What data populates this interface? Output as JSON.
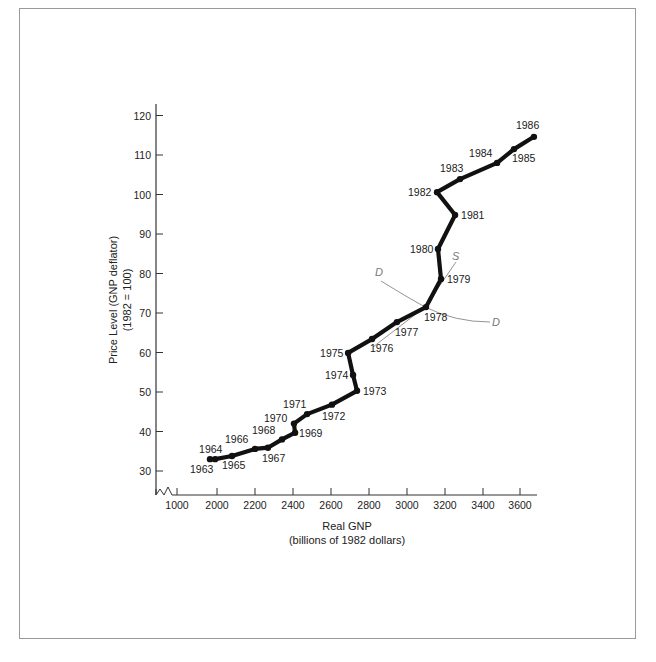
{
  "chart_data": {
    "type": "line",
    "title": "",
    "xlabel": "Real GNP",
    "xlabel_sub": "(billions of 1982 dollars)",
    "ylabel": "Price Level (GNP deflator)",
    "ylabel_sub": "(1982 = 100)",
    "x_ticks": [
      "1000",
      "2000",
      "2200",
      "2400",
      "2600",
      "2800",
      "3000",
      "3200",
      "3400",
      "3600"
    ],
    "y_ticks": [
      "30",
      "40",
      "50",
      "60",
      "70",
      "80",
      "90",
      "100",
      "110",
      "120"
    ],
    "xlim": [
      1900,
      3700
    ],
    "ylim": [
      25,
      122
    ],
    "x_axis_break": true,
    "grid": false,
    "legend": null,
    "series": [
      {
        "name": "Real GNP vs Price Level",
        "points": [
          {
            "year": "1963",
            "x": 1963,
            "y": 33.0
          },
          {
            "year": "1964",
            "x": 1990,
            "y": 33.0
          },
          {
            "year": "1965",
            "x": 2079,
            "y": 33.8
          },
          {
            "year": "1966",
            "x": 2200,
            "y": 35.6
          },
          {
            "year": "1967",
            "x": 2268,
            "y": 35.9
          },
          {
            "year": "1968",
            "x": 2342,
            "y": 38.0
          },
          {
            "year": "1969",
            "x": 2411,
            "y": 39.7
          },
          {
            "year": "1970",
            "x": 2405,
            "y": 42.0
          },
          {
            "year": "1971",
            "x": 2474,
            "y": 44.4
          },
          {
            "year": "1972",
            "x": 2605,
            "y": 46.8
          },
          {
            "year": "1973",
            "x": 2737,
            "y": 50.3
          },
          {
            "year": "1974",
            "x": 2716,
            "y": 54.3
          },
          {
            "year": "1975",
            "x": 2690,
            "y": 59.9
          },
          {
            "year": "1976",
            "x": 2816,
            "y": 63.4
          },
          {
            "year": "1977",
            "x": 2947,
            "y": 67.7
          },
          {
            "year": "1978",
            "x": 3100,
            "y": 71.5
          },
          {
            "year": "1979",
            "x": 3179,
            "y": 78.6
          },
          {
            "year": "1980",
            "x": 3163,
            "y": 86.2
          },
          {
            "year": "1981",
            "x": 3253,
            "y": 94.8
          },
          {
            "year": "1982",
            "x": 3158,
            "y": 100.6
          },
          {
            "year": "1983",
            "x": 3279,
            "y": 103.9
          },
          {
            "year": "1984",
            "x": 3474,
            "y": 108.0
          },
          {
            "year": "1985",
            "x": 3563,
            "y": 111.5
          },
          {
            "year": "1986",
            "x": 3668,
            "y": 114.6
          }
        ]
      }
    ],
    "annotations": [
      {
        "label": "D",
        "type": "demand-curve",
        "description": "Downward sloping aggregate demand curve through 1978 point"
      },
      {
        "label": "S",
        "type": "supply-curve",
        "description": "Upward sloping aggregate supply curve through 1978 point"
      }
    ]
  },
  "labels": {
    "xlabel": "Real GNP",
    "xlabel_sub": "(billions of 1982 dollars)",
    "ylabel": "Price Level (GNP deflator)",
    "ylabel_sub": "(1982 = 100)",
    "demand": "D",
    "supply": "S"
  },
  "colors": {
    "line": "#111111",
    "axis": "#333333",
    "curve": "#888888",
    "frame": "#9a9a9a"
  }
}
